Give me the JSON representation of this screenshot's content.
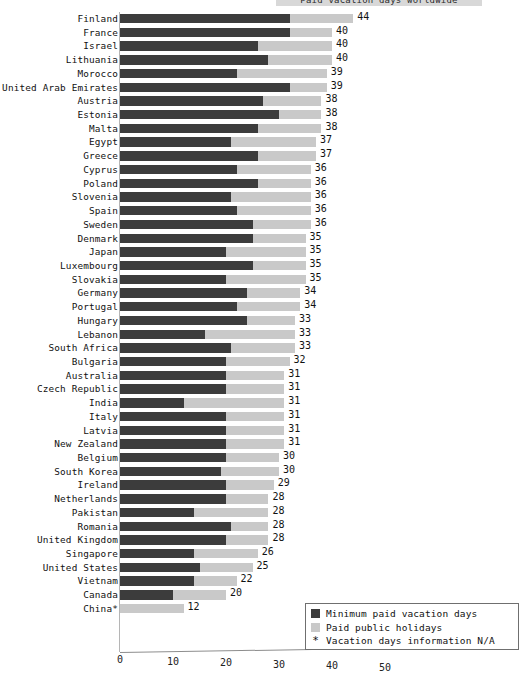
{
  "chart_data": {
    "type": "bar",
    "orientation": "horizontal",
    "stacked": true,
    "title": "Paid vacation days worldwide",
    "xlabel": "",
    "ylabel": "",
    "xlim": [
      0,
      50
    ],
    "xticks": [
      0,
      10,
      20,
      30,
      40,
      50
    ],
    "grid": false,
    "legend_position": "bottom-right",
    "categories": [
      "Finland",
      "France",
      "Israel",
      "Lithuania",
      "Morocco",
      "United Arab Emirates",
      "Austria",
      "Estonia",
      "Malta",
      "Egypt",
      "Greece",
      "Cyprus",
      "Poland",
      "Slovenia",
      "Spain",
      "Sweden",
      "Denmark",
      "Japan",
      "Luxembourg",
      "Slovakia",
      "Germany",
      "Portugal",
      "Hungary",
      "Lebanon",
      "South Africa",
      "Bulgaria",
      "Australia",
      "Czech Republic",
      "India",
      "Italy",
      "Latvia",
      "New Zealand",
      "Belgium",
      "South Korea",
      "Ireland",
      "Netherlands",
      "Pakistan",
      "Romania",
      "United Kingdom",
      "Singapore",
      "United States",
      "Vietnam",
      "Canada",
      "China*"
    ],
    "series": [
      {
        "name": "Minimum paid vacation days",
        "color": "#3c3c3c",
        "values": [
          32,
          32,
          26,
          28,
          22,
          32,
          27,
          30,
          26,
          21,
          26,
          22,
          26,
          21,
          22,
          25,
          25,
          20,
          25,
          20,
          24,
          22,
          24,
          16,
          21,
          20,
          20,
          20,
          12,
          20,
          20,
          20,
          20,
          19,
          20,
          20,
          14,
          21,
          20,
          14,
          15,
          14,
          10,
          0
        ]
      },
      {
        "name": "Paid public holidays",
        "color": "#c9c9c9",
        "values": [
          12,
          8,
          14,
          12,
          17,
          7,
          11,
          8,
          12,
          16,
          11,
          14,
          10,
          15,
          14,
          11,
          10,
          15,
          10,
          15,
          10,
          12,
          9,
          17,
          12,
          12,
          11,
          11,
          19,
          11,
          11,
          11,
          10,
          11,
          9,
          8,
          14,
          7,
          8,
          12,
          10,
          8,
          10,
          12
        ]
      }
    ],
    "totals": [
      44,
      40,
      40,
      40,
      39,
      39,
      38,
      38,
      38,
      37,
      37,
      36,
      36,
      36,
      36,
      36,
      35,
      35,
      35,
      35,
      34,
      34,
      33,
      33,
      33,
      32,
      31,
      31,
      31,
      31,
      31,
      31,
      30,
      30,
      29,
      28,
      28,
      28,
      28,
      26,
      25,
      22,
      20,
      12
    ],
    "legend_entries": [
      {
        "label": "Minimum paid vacation days",
        "swatch": "dark"
      },
      {
        "label": "Paid public holidays",
        "swatch": "light"
      },
      {
        "label": "Vacation days information N/A",
        "swatch": "star"
      }
    ],
    "footnote_symbol": "*"
  }
}
